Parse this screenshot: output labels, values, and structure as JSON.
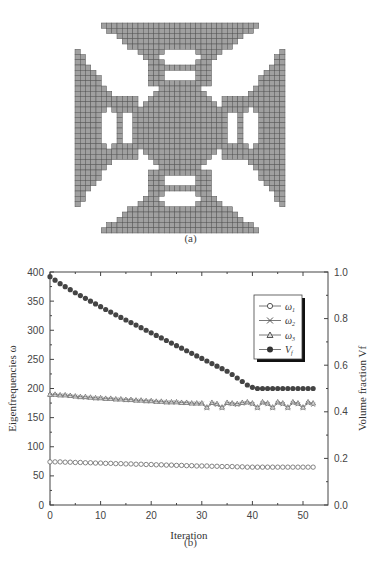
{
  "figure_a": {
    "caption": "(a)",
    "description": "Topology-optimized cross-shaped gray mesh structure",
    "fill_color": "#a0a0a0",
    "grid_color": "#555555"
  },
  "figure_b": {
    "caption": "(b)"
  },
  "chart_data": {
    "type": "scatter",
    "title": "",
    "xlabel": "Iteration",
    "ylabel": "Eigenfrequencies ω",
    "y2label": "Volume fraction V_f",
    "xlim": [
      0,
      55
    ],
    "ylim": [
      0,
      400
    ],
    "y2lim": [
      0.0,
      1.0
    ],
    "xticks": [
      "0",
      "10",
      "20",
      "30",
      "40",
      "50"
    ],
    "yticks": [
      "0",
      "50",
      "100",
      "150",
      "200",
      "250",
      "300",
      "350",
      "400"
    ],
    "y2ticks": [
      "0.0",
      "0.2",
      "0.4",
      "0.6",
      "0.8",
      "1.0"
    ],
    "grid": false,
    "legend_position": "upper right (inside)",
    "legend": [
      "ω1",
      "ω2",
      "ω3",
      "Vf"
    ],
    "x": [
      0,
      1,
      2,
      3,
      4,
      5,
      6,
      7,
      8,
      9,
      10,
      11,
      12,
      13,
      14,
      15,
      16,
      17,
      18,
      19,
      20,
      21,
      22,
      23,
      24,
      25,
      26,
      27,
      28,
      29,
      30,
      31,
      32,
      33,
      34,
      35,
      36,
      37,
      38,
      39,
      40,
      41,
      42,
      43,
      44,
      45,
      46,
      47,
      48,
      49,
      50,
      51,
      52
    ],
    "series": [
      {
        "name": "ω1",
        "marker": "open-circle",
        "axis": "left",
        "values": [
          74,
          74,
          74,
          73.5,
          73.5,
          73,
          73,
          72.5,
          72.5,
          72,
          72,
          71.5,
          71.5,
          71,
          71,
          70.5,
          70.5,
          70,
          70,
          69.5,
          69.5,
          69,
          69,
          68.5,
          68.5,
          68,
          68,
          67.5,
          67.5,
          67,
          67,
          67,
          66.5,
          66.5,
          66,
          66,
          66,
          65.5,
          65.5,
          65,
          65,
          65,
          65,
          65,
          65,
          65,
          65,
          65,
          65,
          65,
          65,
          65,
          65
        ]
      },
      {
        "name": "ω2",
        "marker": "x-cross",
        "axis": "left",
        "values": [
          189,
          189,
          188,
          188,
          187,
          186,
          185,
          184,
          184,
          183,
          183,
          182,
          182,
          181,
          181,
          180,
          180,
          179,
          179,
          178,
          178,
          177,
          177,
          176,
          176,
          176,
          175,
          175,
          174,
          174,
          174,
          166,
          174,
          172,
          166,
          174,
          173,
          172,
          174,
          175,
          173,
          166,
          175,
          173,
          166,
          175,
          173,
          166,
          175,
          173,
          166,
          175,
          172
        ]
      },
      {
        "name": "ω3",
        "marker": "open-triangle",
        "axis": "left",
        "values": [
          190,
          190,
          189,
          189,
          188,
          187,
          186,
          186,
          185,
          184,
          184,
          183,
          183,
          182,
          182,
          181,
          181,
          180,
          180,
          179,
          179,
          178,
          178,
          177,
          177,
          177,
          176,
          176,
          175,
          175,
          175,
          168,
          176,
          174,
          168,
          176,
          175,
          174,
          176,
          177,
          175,
          168,
          177,
          175,
          168,
          177,
          175,
          168,
          177,
          175,
          168,
          177,
          175
        ]
      },
      {
        "name": "Vf",
        "marker": "filled-circle",
        "axis": "right",
        "values": [
          0.98,
          0.965,
          0.95,
          0.937,
          0.924,
          0.911,
          0.899,
          0.887,
          0.875,
          0.863,
          0.851,
          0.839,
          0.828,
          0.816,
          0.805,
          0.794,
          0.783,
          0.772,
          0.761,
          0.75,
          0.739,
          0.728,
          0.717,
          0.706,
          0.695,
          0.684,
          0.673,
          0.662,
          0.651,
          0.64,
          0.629,
          0.618,
          0.607,
          0.596,
          0.585,
          0.574,
          0.56,
          0.545,
          0.53,
          0.515,
          0.505,
          0.5,
          0.5,
          0.5,
          0.5,
          0.5,
          0.5,
          0.5,
          0.5,
          0.5,
          0.5,
          0.5,
          0.5
        ]
      }
    ]
  }
}
